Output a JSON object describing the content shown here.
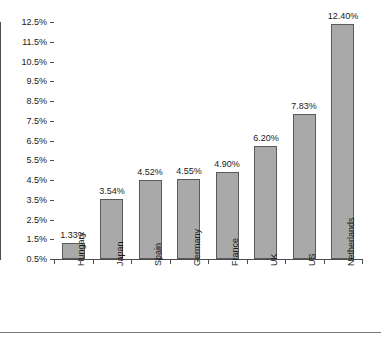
{
  "chart_data": {
    "type": "bar",
    "title": "",
    "xlabel": "",
    "ylabel": "",
    "categories": [
      "Hungary",
      "Japan",
      "Spain",
      "Germany",
      "France",
      "UK",
      "US",
      "Netherlands"
    ],
    "values": [
      1.33,
      3.54,
      4.52,
      4.55,
      4.9,
      6.2,
      7.83,
      12.4
    ],
    "data_labels": [
      "1.33%",
      "3.54%",
      "4.52%",
      "4.55%",
      "4.90%",
      "6.20%",
      "7.83%",
      "12.40%"
    ],
    "ylim": [
      0.5,
      12.5
    ],
    "ytick_values": [
      12.5,
      11.5,
      10.5,
      9.5,
      8.5,
      7.5,
      6.5,
      5.5,
      4.5,
      3.5,
      2.5,
      1.5,
      0.5
    ],
    "ytick_labels": [
      "12.5%",
      "11.5%",
      "10.5%",
      "9.5%",
      "8.5%",
      "7.5%",
      "6.5%",
      "5.5%",
      "4.5%",
      "3.5%",
      "2.5%",
      "1.5%",
      "0.5%"
    ],
    "grid": false,
    "legend": null,
    "series_color": "#a9a9a9",
    "series_border_color": "#5a5a5a",
    "axis_color": "#4d4d4d",
    "text_color": "#1a1a1a"
  }
}
